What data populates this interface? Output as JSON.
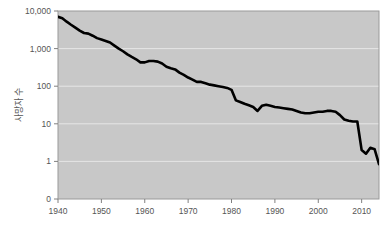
{
  "chart_data": {
    "type": "line",
    "title": "",
    "subtitle": "",
    "xlabel": "",
    "ylabel": "사망자 수",
    "yscale": "log",
    "ylim": [
      0.5,
      10000
    ],
    "xlim": [
      1940,
      2014
    ],
    "grid": true,
    "legend": null,
    "legend_position": "none",
    "line_color": "#000000",
    "plot_bg_color": "#c8c8c8",
    "grid_color": "#e6e6e6",
    "axis_color": "#808080",
    "text_color": "#555555",
    "y_ticks": [
      {
        "label": "10,000",
        "value": 10000
      },
      {
        "label": "1,000",
        "value": 1000
      },
      {
        "label": "100",
        "value": 100
      },
      {
        "label": "10",
        "value": 10
      },
      {
        "label": "1",
        "value": 1
      },
      {
        "label": "0",
        "value": 0.5
      }
    ],
    "x_ticks": [
      {
        "label": "1940",
        "value": 1940
      },
      {
        "label": "1950",
        "value": 1950
      },
      {
        "label": "1960",
        "value": 1960
      },
      {
        "label": "1970",
        "value": 1970
      },
      {
        "label": "1980",
        "value": 1980
      },
      {
        "label": "1990",
        "value": 1990
      },
      {
        "label": "2000",
        "value": 2000
      },
      {
        "label": "2010",
        "value": 2010
      }
    ],
    "series": [
      {
        "name": "사망자 수",
        "x": [
          1940,
          1941,
          1942,
          1943,
          1944,
          1945,
          1946,
          1947,
          1948,
          1949,
          1950,
          1951,
          1952,
          1953,
          1954,
          1955,
          1956,
          1957,
          1958,
          1959,
          1960,
          1961,
          1962,
          1963,
          1964,
          1965,
          1966,
          1967,
          1968,
          1969,
          1970,
          1971,
          1972,
          1973,
          1974,
          1975,
          1976,
          1977,
          1978,
          1979,
          1980,
          1981,
          1982,
          1983,
          1984,
          1985,
          1986,
          1987,
          1988,
          1989,
          1990,
          1991,
          1992,
          1993,
          1994,
          1995,
          1996,
          1997,
          1998,
          1999,
          2000,
          2001,
          2002,
          2003,
          2004,
          2005,
          2006,
          2007,
          2008,
          2009,
          2010,
          2011,
          2012,
          2013,
          2014
        ],
        "values": [
          7000,
          6400,
          5200,
          4300,
          3600,
          3000,
          2600,
          2500,
          2200,
          1900,
          1750,
          1600,
          1450,
          1200,
          1000,
          850,
          700,
          600,
          520,
          430,
          430,
          470,
          470,
          450,
          400,
          330,
          300,
          280,
          230,
          200,
          170,
          150,
          130,
          130,
          120,
          110,
          105,
          100,
          95,
          90,
          80,
          42,
          38,
          34,
          31,
          28,
          22,
          30,
          32,
          30,
          28,
          27,
          26,
          25,
          24,
          22,
          20,
          19,
          19,
          20,
          21,
          21,
          22,
          22,
          21,
          17,
          13,
          12,
          11.5,
          11.5,
          2.0,
          1.6,
          2.3,
          2.1,
          0.85
        ]
      }
    ],
    "annotations": []
  },
  "layout": {
    "plot": {
      "left": 58,
      "top": 11,
      "right": 379,
      "bottom": 199
    },
    "width": 390,
    "height": 233
  },
  "icons": {
    "none": ""
  }
}
